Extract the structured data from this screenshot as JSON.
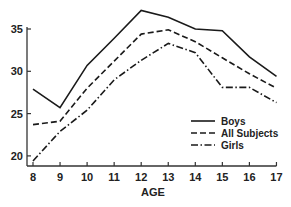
{
  "chart_data": {
    "type": "line",
    "title": "",
    "xlabel": "AGE",
    "ylabel": "",
    "x": [
      8,
      9,
      10,
      11,
      12,
      13,
      14,
      15,
      16,
      17
    ],
    "x_tick_labels": [
      "8",
      "9",
      "10",
      "11",
      "12",
      "13",
      "14",
      "15",
      "16",
      "17"
    ],
    "y_tick_labels": [
      "20",
      "25",
      "30",
      "35"
    ],
    "y_ticks": [
      20,
      25,
      30,
      35
    ],
    "ylim": [
      18.8,
      35
    ],
    "grid": false,
    "legend_position": "lower right (inside plot)",
    "series": [
      {
        "name": "Boys",
        "style": "solid",
        "values": [
          27.9,
          25.7,
          30.7,
          33.9,
          37.2,
          36.4,
          35.0,
          34.8,
          31.7,
          29.4
        ]
      },
      {
        "name": "All Subjects",
        "style": "dashed",
        "values": [
          23.7,
          24.1,
          28.0,
          31.2,
          34.4,
          34.9,
          33.5,
          31.6,
          29.7,
          28.0
        ]
      },
      {
        "name": "Girls",
        "style": "dash-dot",
        "values": [
          19.4,
          22.9,
          25.4,
          29.0,
          31.3,
          33.3,
          32.2,
          28.1,
          28.1,
          26.3
        ]
      }
    ],
    "colors": {
      "line": "#1a1a1a",
      "axis": "#333333",
      "text": "#222222",
      "background": "#ffffff"
    }
  }
}
